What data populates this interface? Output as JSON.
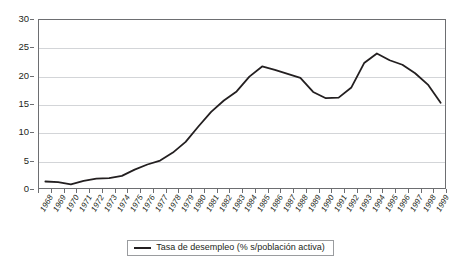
{
  "chart_data": {
    "type": "line",
    "title": "",
    "subtitle": "",
    "xlabel": "",
    "ylabel": "",
    "ylim": [
      0,
      30
    ],
    "ytick_step": 5,
    "yticks": [
      0,
      5,
      10,
      15,
      20,
      25,
      30
    ],
    "ytick_labels": [
      "0",
      "5",
      "10",
      "15",
      "20",
      "25",
      "30"
    ],
    "grid": "horizontal",
    "legend_position": "bottom-center",
    "line_color": "#231f20",
    "frame_color": "#6d6e71",
    "gridline_color": "#d3d5d8",
    "categories": [
      "1968",
      "1969",
      "1970",
      "1971",
      "1972",
      "1973",
      "1974",
      "1975",
      "1976",
      "1977",
      "1978",
      "1979",
      "1980",
      "1981",
      "1982",
      "1983",
      "1984",
      "1985",
      "1986",
      "1987",
      "1988",
      "1989",
      "1990",
      "1991",
      "1992",
      "1993",
      "1994",
      "1995",
      "1996",
      "1997",
      "1998",
      "1999"
    ],
    "series": [
      {
        "name": "Tasa de desempleo (% s/población activa)",
        "values": [
          1.5,
          1.4,
          1.0,
          1.6,
          2.0,
          2.1,
          2.5,
          3.6,
          4.5,
          5.2,
          6.6,
          8.5,
          11.2,
          13.8,
          15.8,
          17.4,
          20.0,
          21.8,
          21.2,
          20.5,
          19.8,
          17.3,
          16.2,
          16.3,
          18.1,
          22.4,
          24.1,
          22.9,
          22.1,
          20.6,
          18.6,
          15.4
        ]
      }
    ]
  },
  "legend": {
    "entries": [
      {
        "label": "Tasa de desempleo (% s/población activa)",
        "swatch": "line-swatch"
      }
    ]
  }
}
